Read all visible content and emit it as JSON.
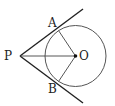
{
  "diagram": {
    "type": "geometry",
    "points": {
      "P": {
        "label": "P",
        "x": 20,
        "y": 56
      },
      "O": {
        "label": "O",
        "x": 75.5,
        "y": 56
      },
      "A": {
        "label": "A",
        "x": 58.5,
        "y": 30.5
      },
      "B": {
        "label": "B",
        "x": 58.5,
        "y": 81.5
      }
    },
    "circle": {
      "center": "O",
      "radius": 30.5
    },
    "segments": [
      {
        "from": "P",
        "to": "O"
      },
      {
        "from": "O",
        "to": "A"
      },
      {
        "from": "O",
        "to": "B"
      }
    ],
    "tangent_rays": [
      {
        "from": "P",
        "through": "A"
      },
      {
        "from": "P",
        "through": "B"
      }
    ],
    "colors": {
      "stroke": "#222222",
      "circle": "#555555"
    }
  }
}
